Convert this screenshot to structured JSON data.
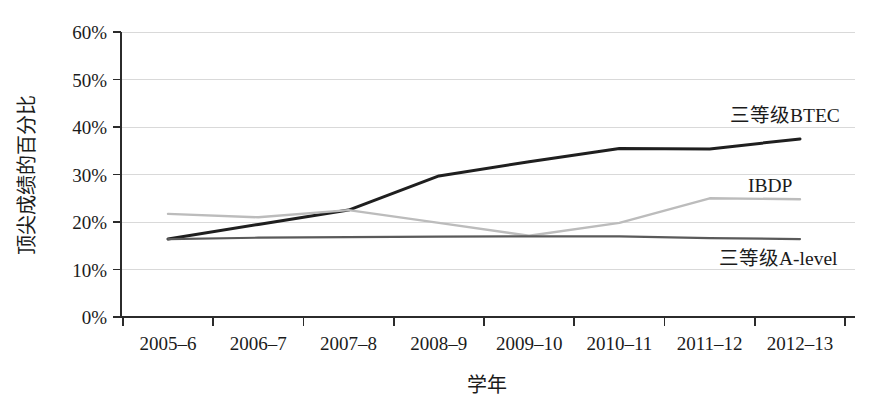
{
  "chart_data": {
    "type": "line",
    "title": "",
    "subtitle": "",
    "xlabel": "学年",
    "ylabel": "顶尖成绩的百分比",
    "categories": [
      "2005–6",
      "2006–7",
      "2007–8",
      "2008–9",
      "2009–10",
      "2010–11",
      "2011–12",
      "2012–13"
    ],
    "x": [
      "2005–6",
      "2006–7",
      "2007–8",
      "2008–9",
      "2009–10",
      "2010–11",
      "2011–12",
      "2012–13"
    ],
    "ylim": [
      0,
      60
    ],
    "yticks": [
      0,
      10,
      20,
      30,
      40,
      50,
      60
    ],
    "ytick_labels": [
      "0%",
      "10%",
      "20%",
      "30%",
      "40%",
      "50%",
      "60%"
    ],
    "grid": true,
    "legend": "inline-end-labels",
    "series": [
      {
        "name": "三等级BTEC",
        "color": "#1f1f1f",
        "width": 3.0,
        "values": [
          16.4,
          19.5,
          22.5,
          29.7,
          32.7,
          35.5,
          35.4,
          37.5
        ]
      },
      {
        "name": "IBDP",
        "color": "#bcbcbc",
        "width": 2.4,
        "values": [
          21.7,
          21.0,
          22.5,
          19.8,
          17.1,
          19.8,
          25.0,
          24.8
        ]
      },
      {
        "name": "三等级A-level",
        "color": "#5a5a5a",
        "width": 2.2,
        "values": [
          16.4,
          16.7,
          16.8,
          16.9,
          17.0,
          17.0,
          16.6,
          16.4
        ]
      }
    ],
    "annotations": [
      {
        "text": "三等级BTEC",
        "series": "三等级BTEC",
        "x": 730,
        "y": 122
      },
      {
        "text": "IBDP",
        "series": "IBDP",
        "x": 748,
        "y": 192
      },
      {
        "text": "三等级A-level",
        "series": "三等级A-level",
        "x": 719,
        "y": 265
      }
    ]
  },
  "axes": {
    "y_title": "顶尖成绩的百分比",
    "x_title": "学年"
  }
}
